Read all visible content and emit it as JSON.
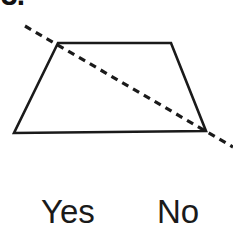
{
  "question": {
    "number_fragment": "3.",
    "figure": {
      "shape_name": "trapezoid",
      "line_name": "dashed-line",
      "stroke_color": "#1a1a1a",
      "fill_color": "#ffffff",
      "background_color": "#ffffff",
      "shape_stroke_width": 2.6,
      "line_stroke_width": 3.2,
      "dash_pattern": "7 5.5",
      "vertices": [
        {
          "name": "top-left",
          "x": 58,
          "y": 43
        },
        {
          "name": "top-right",
          "x": 171,
          "y": 43
        },
        {
          "name": "bottom-right",
          "x": 206,
          "y": 131
        },
        {
          "name": "bottom-left",
          "x": 14,
          "y": 133
        }
      ],
      "dashed_line_endpoints": [
        {
          "name": "start",
          "x": 25,
          "y": 26
        },
        {
          "name": "end",
          "x": 233,
          "y": 147
        }
      ]
    }
  },
  "answers": {
    "yes_label": "Yes",
    "no_label": "No"
  }
}
